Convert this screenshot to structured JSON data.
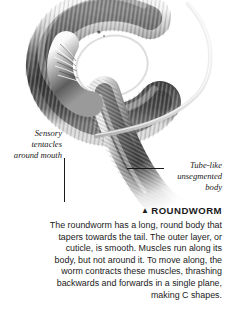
{
  "figure": {
    "background_color": "#ffffff",
    "ink_color": "#1a1a1a"
  },
  "callouts": [
    {
      "name": "sensory-tentacles",
      "lines": [
        "Sensory",
        "tentacles",
        "around mouth"
      ],
      "align": "right"
    },
    {
      "name": "tube-like-body",
      "lines": [
        "Tube-like",
        "unsegmented",
        "body"
      ],
      "align": "right"
    }
  ],
  "caption": {
    "marker": "▲",
    "title": "ROUNDWORM",
    "body": "The roundworm has a long, round body that tapers towards the tail. The outer layer, or cuticle, is smooth. Muscles run along its body, but not around it. To move along, the worm contracts these muscles, thrashing backwards and forwards in a single plane, making C shapes."
  }
}
